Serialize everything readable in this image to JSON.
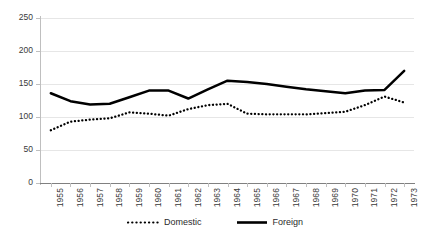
{
  "chart_data": {
    "type": "line",
    "title": "",
    "subtitle": "",
    "xlabel": "",
    "ylabel": "",
    "categories": [
      "1955",
      "1956",
      "1957",
      "1958",
      "1959",
      "1960",
      "1961",
      "1962",
      "1963",
      "1964",
      "1965",
      "1966",
      "1967",
      "1968",
      "1969",
      "1970",
      "1971",
      "1972",
      "1973"
    ],
    "series": [
      {
        "name": "Domestic",
        "style": "dotted",
        "color": "#000000",
        "values": [
          80,
          93,
          96,
          98,
          107,
          105,
          102,
          112,
          118,
          120,
          105,
          104,
          104,
          104,
          106,
          108,
          118,
          131,
          122
        ]
      },
      {
        "name": "Foreign",
        "style": "solid",
        "color": "#000000",
        "values": [
          136,
          124,
          119,
          120,
          130,
          140,
          140,
          128,
          142,
          155,
          153,
          150,
          146,
          142,
          139,
          136,
          140,
          141,
          170
        ]
      }
    ],
    "ylim": [
      0,
      250
    ],
    "yticks": [
      0,
      50,
      100,
      150,
      200,
      250
    ],
    "ytick_labels": [
      "0",
      "50",
      "100",
      "150",
      "200",
      "250"
    ],
    "grid": true,
    "grid_color": "#e6e6e6",
    "legend_position": "bottom",
    "axis_color": "#bfbfbf",
    "background": "#ffffff"
  },
  "legend": {
    "entries": [
      {
        "label": "Domestic",
        "icon": "dotted-line-swatch"
      },
      {
        "label": "Foreign",
        "icon": "solid-line-swatch"
      }
    ]
  }
}
